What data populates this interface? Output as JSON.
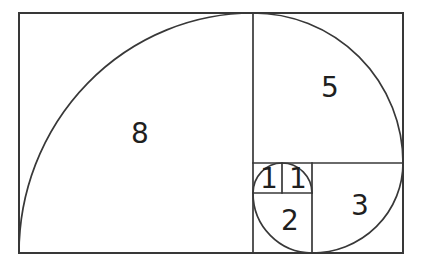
{
  "diagram": {
    "type": "fibonacci-golden-spiral",
    "sequence": [
      1,
      1,
      2,
      3,
      5,
      8
    ],
    "squares": [
      {
        "label": "8",
        "value": 8
      },
      {
        "label": "5",
        "value": 5
      },
      {
        "label": "3",
        "value": 3
      },
      {
        "label": "2",
        "value": 2
      },
      {
        "label": "1",
        "value": 1
      },
      {
        "label": "1",
        "value": 1
      }
    ],
    "colors": {
      "stroke": "#383838",
      "background": "#ffffff",
      "text": "#1f1f1f"
    }
  }
}
